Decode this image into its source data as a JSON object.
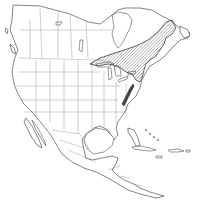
{
  "map": {
    "region": "North America",
    "type": "species range map",
    "legend": [],
    "range_areas": [
      {
        "name": "main-range",
        "description": "Hatched range across Ontario, Quebec, northeastern USA and Maritime provinces",
        "style": "hatched"
      },
      {
        "name": "appalachian-outlier",
        "description": "Isolated range along the Appalachian Mountains",
        "style": "hatched"
      }
    ],
    "colors": {
      "land": "#ffffff",
      "outline": "#333333",
      "hatch": "#555555"
    }
  }
}
